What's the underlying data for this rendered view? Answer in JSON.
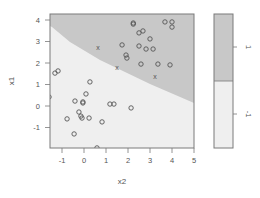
{
  "chart_data": {
    "type": "scatter",
    "title": "",
    "xlabel": "x2",
    "ylabel": "x1",
    "xlim": [
      -1.55,
      5.0
    ],
    "ylim": [
      -1.95,
      4.3
    ],
    "x_ticks": [
      -1,
      0,
      1,
      2,
      3,
      4,
      5
    ],
    "y_ticks": [
      -1,
      0,
      1,
      2,
      3,
      4
    ],
    "grid": false,
    "background_regions": [
      {
        "class": "1",
        "color": "#c8c8c8",
        "region": "upper-right (above decision boundary)"
      },
      {
        "class": "-1",
        "color": "#efefef",
        "region": "lower-left (below decision boundary)"
      }
    ],
    "decision_boundary": {
      "from": [
        -1.55,
        3.6
      ],
      "to": [
        5.0,
        0.2
      ]
    },
    "legend": {
      "position": "right",
      "type": "colorbar",
      "entries": [
        {
          "label": "1",
          "color": "#c8c8c8"
        },
        {
          "label": "-1",
          "color": "#efefef"
        }
      ]
    },
    "series": [
      {
        "name": "non-support-vectors",
        "marker": "o",
        "points": [
          {
            "x2": 2.24,
            "x1": 3.86
          },
          {
            "x2": 2.24,
            "x1": 3.81
          },
          {
            "x2": 3.68,
            "x1": 3.91
          },
          {
            "x2": 4.0,
            "x1": 3.91
          },
          {
            "x2": 4.0,
            "x1": 3.67
          },
          {
            "x2": 2.5,
            "x1": 3.4
          },
          {
            "x2": 2.68,
            "x1": 3.49
          },
          {
            "x2": 3.0,
            "x1": 3.12
          },
          {
            "x2": 1.73,
            "x1": 2.84
          },
          {
            "x2": 2.5,
            "x1": 2.79
          },
          {
            "x2": 2.82,
            "x1": 2.65
          },
          {
            "x2": 3.14,
            "x1": 2.65
          },
          {
            "x2": 1.91,
            "x1": 2.37
          },
          {
            "x2": 1.95,
            "x1": 2.23
          },
          {
            "x2": 2.59,
            "x1": 1.95
          },
          {
            "x2": 3.36,
            "x1": 1.95
          },
          {
            "x2": 3.91,
            "x1": 1.91
          },
          {
            "x2": -1.32,
            "x1": 1.53
          },
          {
            "x2": -1.18,
            "x1": 1.63
          },
          {
            "x2": 0.27,
            "x1": 1.12
          },
          {
            "x2": 0.09,
            "x1": 0.56
          },
          {
            "x2": -0.41,
            "x1": 0.23
          },
          {
            "x2": -0.05,
            "x1": 0.19
          },
          {
            "x2": -0.05,
            "x1": 0.14
          },
          {
            "x2": 1.18,
            "x1": 0.09
          },
          {
            "x2": 1.36,
            "x1": 0.09
          },
          {
            "x2": 2.14,
            "x1": -0.09
          },
          {
            "x2": -0.23,
            "x1": -0.28
          },
          {
            "x2": -0.14,
            "x1": -0.47
          },
          {
            "x2": -0.09,
            "x1": -0.56
          },
          {
            "x2": 0.23,
            "x1": -0.56
          },
          {
            "x2": -0.77,
            "x1": -0.6
          },
          {
            "x2": 0.82,
            "x1": -0.74
          },
          {
            "x2": -0.45,
            "x1": -1.3
          },
          {
            "x2": 0.59,
            "x1": -1.95
          },
          {
            "x2": -1.59,
            "x1": 0.42
          }
        ]
      },
      {
        "name": "support-vectors",
        "marker": "x",
        "points": [
          {
            "x2": 0.64,
            "x1": 2.7
          },
          {
            "x2": 1.5,
            "x1": 1.81
          },
          {
            "x2": 3.23,
            "x1": 1.35
          }
        ]
      }
    ]
  }
}
